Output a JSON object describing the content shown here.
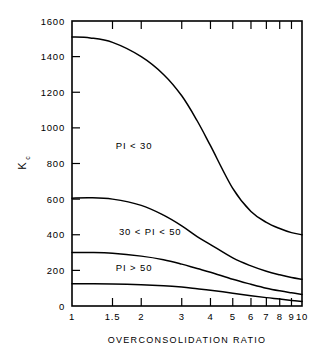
{
  "chart_data": {
    "type": "line",
    "title": "",
    "xlabel": "OVERCONSOLIDATION RATIO",
    "ylabel": "Kc",
    "ylabel_main": "K",
    "ylabel_sub": "c",
    "xscale": "log",
    "yscale": "linear",
    "xlim": [
      1,
      10
    ],
    "ylim": [
      0,
      1600
    ],
    "grid": false,
    "legend": "none",
    "xticks": [
      1,
      1.5,
      2,
      3,
      4,
      5,
      6,
      7,
      8,
      9,
      10
    ],
    "xtick_labels": [
      "1",
      "1.5",
      "2",
      "3",
      "4",
      "5",
      "6",
      "7",
      "8",
      "9",
      "10"
    ],
    "yticks": [
      0,
      200,
      400,
      600,
      800,
      1000,
      1200,
      1400,
      1600
    ],
    "ytick_labels": [
      "0",
      "200",
      "400",
      "600",
      "800",
      "1000",
      "1200",
      "1400",
      "1600"
    ],
    "line_color": "#000000",
    "background_color": "#ffffff",
    "annotations": [
      {
        "text": "PI < 30",
        "x": 1.55,
        "y": 880
      },
      {
        "text": "30 < PI < 50",
        "x": 1.6,
        "y": 400
      },
      {
        "text": "PI > 50",
        "x": 1.55,
        "y": 195
      }
    ],
    "series": [
      {
        "name": "PI < 30 upper bound",
        "x": [
          1,
          1.2,
          1.5,
          2,
          2.5,
          3,
          3.5,
          4,
          5,
          6,
          7,
          8,
          9,
          10
        ],
        "values": [
          1510,
          1505,
          1480,
          1400,
          1300,
          1180,
          1040,
          900,
          660,
          530,
          470,
          435,
          412,
          400
        ]
      },
      {
        "name": "PI < 30 / 30 < PI < 50 boundary",
        "x": [
          1,
          1.2,
          1.5,
          2,
          2.5,
          3,
          3.5,
          4,
          5,
          6,
          7,
          8,
          9,
          10
        ],
        "values": [
          605,
          608,
          600,
          565,
          510,
          450,
          390,
          345,
          270,
          225,
          195,
          175,
          160,
          150
        ]
      },
      {
        "name": "30 < PI < 50 / PI > 50 boundary",
        "x": [
          1,
          1.2,
          1.5,
          2,
          2.5,
          3,
          3.5,
          4,
          5,
          6,
          7,
          8,
          9,
          10
        ],
        "values": [
          300,
          300,
          296,
          280,
          260,
          235,
          210,
          190,
          150,
          122,
          100,
          85,
          74,
          65
        ]
      },
      {
        "name": "PI > 50 lower bound",
        "x": [
          1,
          1.2,
          1.5,
          2,
          2.5,
          3,
          3.5,
          4,
          5,
          6,
          7,
          8,
          9,
          10
        ],
        "values": [
          125,
          125,
          124,
          120,
          114,
          106,
          97,
          89,
          72,
          58,
          47,
          39,
          31,
          25
        ]
      }
    ]
  }
}
